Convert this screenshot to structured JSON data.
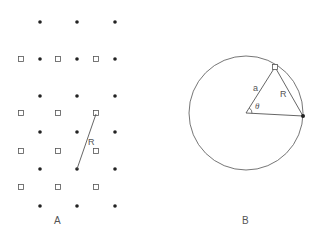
{
  "figure": {
    "panels": [
      {
        "id": "A",
        "label": "A",
        "description": "Two interpenetrating square lattices: filled dots and open squares",
        "dots": [
          [
            40,
            22
          ],
          [
            77,
            22
          ],
          [
            115,
            22
          ],
          [
            40,
            59
          ],
          [
            77,
            59
          ],
          [
            115,
            59
          ],
          [
            40,
            96
          ],
          [
            77,
            96
          ],
          [
            115,
            96
          ],
          [
            40,
            132
          ],
          [
            77,
            132
          ],
          [
            115,
            132
          ],
          [
            40,
            169
          ],
          [
            77,
            169
          ],
          [
            115,
            169
          ],
          [
            40,
            206
          ],
          [
            77,
            206
          ],
          [
            115,
            206
          ]
        ],
        "squares": [
          [
            21,
            59
          ],
          [
            58,
            59
          ],
          [
            96,
            59
          ],
          [
            21,
            113
          ],
          [
            58,
            113
          ],
          [
            96,
            113
          ],
          [
            21,
            151
          ],
          [
            58,
            151
          ],
          [
            96,
            151
          ],
          [
            21,
            187
          ],
          [
            58,
            187
          ],
          [
            96,
            187
          ]
        ],
        "vector": {
          "from": [
            96,
            114
          ],
          "to": [
            77,
            169
          ],
          "label": "R"
        }
      },
      {
        "id": "B",
        "label": "B",
        "circle": {
          "cx": 246,
          "cy": 113,
          "r": 57
        },
        "center": [
          246,
          113
        ],
        "square_point": [
          275,
          67
        ],
        "dot_point": [
          303,
          116
        ],
        "labels": {
          "radius": "a",
          "chord": "R",
          "angle": "θ"
        }
      }
    ],
    "colors": {
      "stroke": "#555555",
      "dot": "#222222",
      "text": "#555555"
    }
  }
}
